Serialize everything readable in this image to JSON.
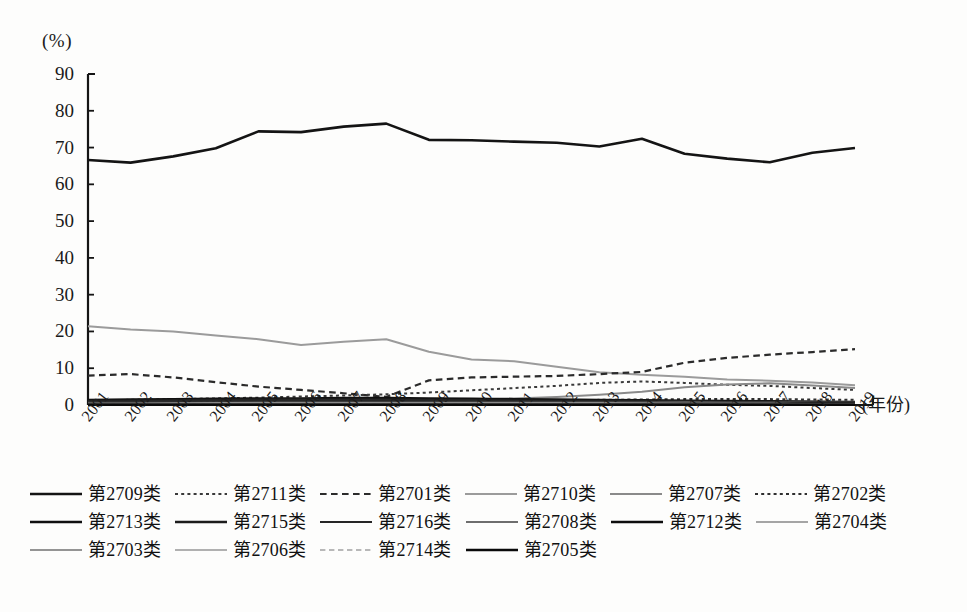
{
  "axis": {
    "unit_label": "(%)",
    "x_title": "(年份)",
    "y_ticks": [
      "90",
      "80",
      "70",
      "60",
      "50",
      "40",
      "30",
      "20",
      "10",
      "0"
    ],
    "x_ticks": [
      "2001",
      "2002",
      "2003",
      "2004",
      "2005",
      "2006",
      "2007",
      "2008",
      "2009",
      "2010",
      "2011",
      "2012",
      "2013",
      "2014",
      "2015",
      "2016",
      "2017",
      "2018",
      "2019"
    ]
  },
  "legend": {
    "rows": [
      [
        {
          "label": "第2709类",
          "style": "solid",
          "color": "#141414",
          "width": 2.6
        },
        {
          "label": "第2711类",
          "style": "dotted",
          "color": "#3a3a3a",
          "width": 2.0
        },
        {
          "label": "第2701类",
          "style": "dashed",
          "color": "#2b2b2b",
          "width": 2.2
        },
        {
          "label": "第2710类",
          "style": "solid",
          "color": "#9b9b9b",
          "width": 2.0
        },
        {
          "label": "第2707类",
          "style": "solid",
          "color": "#8a8a8a",
          "width": 2.0
        },
        {
          "label": "第2702类",
          "style": "dotted",
          "color": "#2f2f2f",
          "width": 2.0
        }
      ],
      [
        {
          "label": "第2713类",
          "style": "solid",
          "color": "#101010",
          "width": 2.4
        },
        {
          "label": "第2715类",
          "style": "solid",
          "color": "#1c1c1c",
          "width": 2.4
        },
        {
          "label": "第2716类",
          "style": "solid",
          "color": "#262626",
          "width": 2.2
        },
        {
          "label": "第2708类",
          "style": "solid",
          "color": "#6e6e6e",
          "width": 2.0
        },
        {
          "label": "第2712类",
          "style": "solid",
          "color": "#0d0d0d",
          "width": 2.6
        },
        {
          "label": "第2704类",
          "style": "solid",
          "color": "#a5a5a5",
          "width": 2.0
        }
      ],
      [
        {
          "label": "第2703类",
          "style": "solid",
          "color": "#949494",
          "width": 2.0
        },
        {
          "label": "第2706类",
          "style": "solid",
          "color": "#b0b0b0",
          "width": 1.8
        },
        {
          "label": "第2714类",
          "style": "dashed",
          "color": "#b8b8b8",
          "width": 1.8
        },
        {
          "label": "第2705类",
          "style": "solid",
          "color": "#0a0a0a",
          "width": 2.6
        }
      ]
    ]
  },
  "chart_data": {
    "type": "line",
    "title": "",
    "xlabel": "(年份)",
    "ylabel": "(%)",
    "ylim": [
      0,
      90
    ],
    "grid": false,
    "legend_position": "bottom",
    "x": [
      2001,
      2002,
      2003,
      2004,
      2005,
      2006,
      2007,
      2008,
      2009,
      2010,
      2011,
      2012,
      2013,
      2014,
      2015,
      2016,
      2017,
      2018,
      2019
    ],
    "series": [
      {
        "name": "第2709类",
        "style": "solid",
        "color": "#141414",
        "width": 2.6,
        "values": [
          66.6,
          65.9,
          67.6,
          69.8,
          74.4,
          74.2,
          75.7,
          76.5,
          72.1,
          72.0,
          71.6,
          71.3,
          70.3,
          72.4,
          68.3,
          67.0,
          66.0,
          68.6,
          69.9
        ]
      },
      {
        "name": "第2710类",
        "style": "solid",
        "color": "#9b9b9b",
        "width": 2.0,
        "values": [
          21.4,
          20.5,
          20.0,
          18.9,
          17.9,
          16.3,
          17.2,
          17.9,
          14.5,
          12.4,
          11.9,
          10.4,
          8.9,
          8.2,
          7.7,
          6.9,
          6.6,
          6.1,
          5.4
        ]
      },
      {
        "name": "第2701类",
        "style": "dashed",
        "color": "#2b2b2b",
        "width": 2.2,
        "values": [
          8.0,
          8.4,
          7.5,
          6.2,
          5.0,
          4.1,
          3.2,
          2.2,
          6.7,
          7.5,
          7.7,
          7.9,
          8.4,
          9.0,
          11.5,
          12.8,
          13.7,
          14.4,
          15.2
        ]
      },
      {
        "name": "第2711类",
        "style": "dotted",
        "color": "#3a3a3a",
        "width": 2.0,
        "values": [
          1.3,
          1.4,
          1.6,
          1.8,
          2.0,
          2.3,
          2.6,
          2.9,
          3.4,
          4.0,
          4.6,
          5.2,
          6.0,
          6.4,
          6.0,
          5.5,
          5.2,
          4.6,
          4.1
        ]
      },
      {
        "name": "第2707类",
        "style": "solid",
        "color": "#8a8a8a",
        "width": 2.0,
        "values": [
          0.7,
          0.7,
          0.8,
          0.8,
          0.9,
          0.9,
          1.0,
          1.1,
          1.3,
          1.5,
          1.8,
          2.2,
          2.8,
          3.6,
          4.8,
          5.6,
          5.9,
          5.3,
          4.6
        ]
      },
      {
        "name": "第2702类",
        "style": "dotted",
        "color": "#2f2f2f",
        "width": 2.0,
        "values": [
          0.9,
          0.9,
          0.9,
          0.9,
          1.0,
          1.0,
          1.0,
          1.0,
          1.1,
          1.2,
          1.2,
          1.3,
          1.4,
          1.5,
          1.6,
          1.6,
          1.6,
          1.5,
          1.4
        ]
      },
      {
        "name": "第2713类",
        "style": "solid",
        "color": "#101010",
        "width": 2.4,
        "values": [
          1.4,
          1.5,
          1.6,
          1.7,
          1.8,
          1.8,
          1.9,
          1.9,
          1.8,
          1.7,
          1.6,
          1.5,
          1.4,
          1.3,
          1.2,
          1.1,
          1.0,
          0.9,
          0.8
        ]
      },
      {
        "name": "第2715类",
        "style": "solid",
        "color": "#1c1c1c",
        "width": 2.4,
        "values": [
          1.1,
          1.2,
          1.3,
          1.4,
          1.5,
          1.5,
          1.5,
          1.5,
          1.4,
          1.3,
          1.2,
          1.2,
          1.1,
          1.1,
          1.0,
          0.9,
          0.9,
          0.8,
          0.7
        ]
      },
      {
        "name": "第2716类",
        "style": "solid",
        "color": "#262626",
        "width": 2.2,
        "values": [
          0.9,
          1.0,
          1.1,
          1.2,
          1.2,
          1.3,
          1.3,
          1.3,
          1.2,
          1.2,
          1.1,
          1.0,
          1.0,
          0.9,
          0.9,
          0.8,
          0.7,
          0.7,
          0.6
        ]
      },
      {
        "name": "第2708类",
        "style": "solid",
        "color": "#6e6e6e",
        "width": 2.0,
        "values": [
          0.6,
          0.6,
          0.7,
          0.7,
          0.8,
          0.8,
          0.8,
          0.8,
          0.8,
          0.8,
          0.8,
          0.8,
          0.8,
          0.8,
          0.8,
          0.7,
          0.7,
          0.6,
          0.6
        ]
      },
      {
        "name": "第2712类",
        "style": "solid",
        "color": "#0d0d0d",
        "width": 2.6,
        "values": [
          0.5,
          0.5,
          0.6,
          0.6,
          0.6,
          0.6,
          0.6,
          0.6,
          0.6,
          0.6,
          0.6,
          0.6,
          0.6,
          0.6,
          0.5,
          0.5,
          0.5,
          0.4,
          0.4
        ]
      },
      {
        "name": "第2704类",
        "style": "solid",
        "color": "#a5a5a5",
        "width": 2.0,
        "values": [
          0.4,
          0.4,
          0.4,
          0.5,
          0.5,
          0.5,
          0.5,
          0.5,
          0.5,
          0.5,
          0.5,
          0.5,
          0.5,
          0.4,
          0.4,
          0.4,
          0.4,
          0.3,
          0.3
        ]
      },
      {
        "name": "第2703类",
        "style": "solid",
        "color": "#949494",
        "width": 2.0,
        "values": [
          0.3,
          0.3,
          0.4,
          0.4,
          0.4,
          0.4,
          0.4,
          0.4,
          0.4,
          0.4,
          0.4,
          0.4,
          0.4,
          0.4,
          0.3,
          0.3,
          0.3,
          0.3,
          0.2
        ]
      },
      {
        "name": "第2706类",
        "style": "solid",
        "color": "#b0b0b0",
        "width": 1.8,
        "values": [
          0.2,
          0.2,
          0.3,
          0.3,
          0.3,
          0.3,
          0.3,
          0.3,
          0.3,
          0.3,
          0.3,
          0.3,
          0.3,
          0.3,
          0.2,
          0.2,
          0.2,
          0.2,
          0.2
        ]
      },
      {
        "name": "第2714类",
        "style": "dashed",
        "color": "#b8b8b8",
        "width": 1.8,
        "values": [
          0.15,
          0.15,
          0.2,
          0.2,
          0.2,
          0.2,
          0.2,
          0.2,
          0.2,
          0.2,
          0.2,
          0.2,
          0.2,
          0.2,
          0.2,
          0.15,
          0.15,
          0.15,
          0.1
        ]
      },
      {
        "name": "第2705类",
        "style": "solid",
        "color": "#0a0a0a",
        "width": 2.6,
        "values": [
          0.1,
          0.1,
          0.1,
          0.1,
          0.1,
          0.1,
          0.1,
          0.1,
          0.1,
          0.1,
          0.1,
          0.1,
          0.1,
          0.1,
          0.1,
          0.1,
          0.1,
          0.1,
          0.1
        ]
      }
    ]
  }
}
